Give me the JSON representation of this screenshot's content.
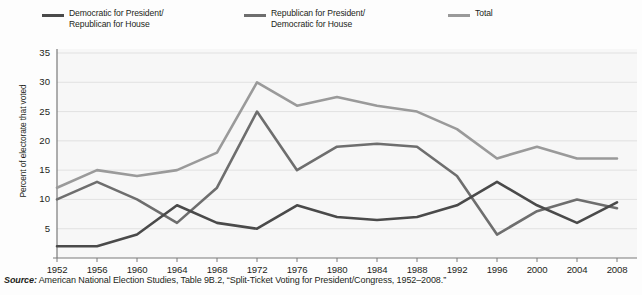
{
  "legend": {
    "entries": [
      {
        "label": "Democratic for President/\nRepublican for House",
        "color": "#4a4a4a",
        "name": "democratic-president-republican-house"
      },
      {
        "label": "Republican for President/\nDemocratic for House",
        "color": "#6e6e6e",
        "name": "republican-president-democratic-house"
      },
      {
        "label": "Total",
        "color": "#9a9a9a",
        "name": "total"
      }
    ]
  },
  "source": {
    "label": "Source:",
    "text": " American National Election Studies, Table 9B.2, “Split-Ticket Voting for President/Congress, 1952–2008.”"
  },
  "chart_data": {
    "type": "line",
    "title": "",
    "xlabel": "",
    "ylabel": "Percent of electorate that voted",
    "categories": [
      1952,
      1956,
      1960,
      1964,
      1968,
      1972,
      1976,
      1980,
      1984,
      1988,
      1992,
      1996,
      2000,
      2004,
      2008
    ],
    "xtick_labels": [
      "1952",
      "1956",
      "1960",
      "1964",
      "1968",
      "1972",
      "1976",
      "1980",
      "1984",
      "1988",
      "1992",
      "1996",
      "2000",
      "2004",
      "2008"
    ],
    "ytick_labels": [
      "5",
      "10",
      "15",
      "20",
      "25",
      "30",
      "35"
    ],
    "yticks": [
      5,
      10,
      15,
      20,
      25,
      30,
      35
    ],
    "ylim": [
      0,
      35
    ],
    "xlim": [
      1952,
      2008
    ],
    "grid": true,
    "legend_position": "above-plot",
    "series": [
      {
        "name": "Democratic for President/Republican for House",
        "color": "#4a4a4a",
        "values": [
          2,
          2,
          4,
          9,
          6,
          5,
          9,
          7,
          6.5,
          7,
          9,
          13,
          9,
          6,
          9.5
        ]
      },
      {
        "name": "Republican for President/Democratic for House",
        "color": "#6e6e6e",
        "values": [
          10,
          13,
          10,
          6,
          12,
          25,
          15,
          19,
          19.5,
          19,
          14,
          4,
          8,
          10,
          8.5
        ]
      },
      {
        "name": "Total",
        "color": "#9a9a9a",
        "values": [
          12,
          15,
          14,
          15,
          18,
          30,
          26,
          27.5,
          26,
          25,
          22,
          17,
          19,
          17,
          17
        ]
      }
    ]
  }
}
